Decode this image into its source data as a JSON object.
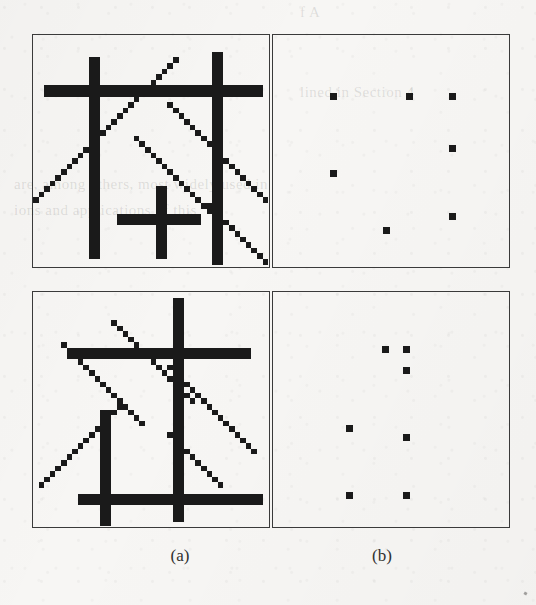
{
  "figure": {
    "kind": "line-intersection-detection-figure",
    "background_color": "#f7f6f4",
    "ink_color": "#1a1a1a",
    "border_color": "#3a3a3a",
    "page_bleed_text": [
      {
        "text": "f A",
        "x": 300,
        "y": 4,
        "size": 15
      },
      {
        "text": "lined in Section 4",
        "x": 300,
        "y": 84,
        "size": 15
      },
      {
        "text": "are, among others, most widely used in",
        "x": 14,
        "y": 176,
        "size": 15
      },
      {
        "text": "ions and applications of  this",
        "x": 14,
        "y": 202,
        "size": 15
      }
    ],
    "captions": [
      {
        "label": "(a)",
        "name": "caption-a",
        "x": 120,
        "y": 546,
        "width": 120
      },
      {
        "label": "(b)",
        "name": "caption-b",
        "x": 322,
        "y": 546,
        "width": 120
      }
    ],
    "panels": [
      {
        "name": "panel-top-left",
        "row": "top",
        "column": "a",
        "label": "(a)",
        "content": "line-drawing",
        "x": 32,
        "y": 34,
        "width": 238,
        "height": 234,
        "grid": {
          "cols": 42,
          "rows": 41,
          "cell": 5.6
        },
        "strokes": [
          {
            "name": "vertical-line-1",
            "type": "v",
            "col": 10,
            "row_start": 4,
            "row_end": 40,
            "thick": 2
          },
          {
            "name": "vertical-line-2",
            "type": "v",
            "col": 32,
            "row_start": 3,
            "row_end": 41,
            "thick": 2
          },
          {
            "name": "horizontal-line-1",
            "type": "h",
            "row": 9,
            "col_start": 2,
            "col_end": 41,
            "thick": 2
          },
          {
            "name": "horizontal-line-2",
            "type": "h",
            "row": 32,
            "col_start": 15,
            "col_end": 30,
            "thick": 2
          },
          {
            "name": "vertical-line-3",
            "type": "v",
            "col": 22,
            "row_start": 27,
            "row_end": 40,
            "thick": 2
          },
          {
            "name": "diagonal-up-1",
            "type": "d",
            "col_start": 0,
            "row_start": 29,
            "col_end": 25,
            "row_end": 6,
            "thick": 1.4
          },
          {
            "name": "diagonal-down-1",
            "type": "d",
            "col_start": 24,
            "row_start": 12,
            "col_end": 41,
            "row_end": 26,
            "thick": 1.4
          },
          {
            "name": "diagonal-down-2",
            "type": "d",
            "col_start": 18,
            "row_start": 18,
            "col_end": 33,
            "row_end": 33,
            "thick": 1.4
          },
          {
            "name": "diagonal-down-3",
            "type": "d",
            "col_start": 31,
            "row_start": 30,
            "col_end": 41,
            "row_end": 40,
            "thick": 1.4
          }
        ]
      },
      {
        "name": "panel-top-right",
        "row": "top",
        "column": "b",
        "label": "(b)",
        "content": "intersection-points",
        "x": 272,
        "y": 34,
        "width": 238,
        "height": 234,
        "dot_size": 7,
        "dots": [
          {
            "name": "intersection-point",
            "x": 57,
            "y": 58
          },
          {
            "name": "intersection-point",
            "x": 133,
            "y": 58
          },
          {
            "name": "intersection-point",
            "x": 176,
            "y": 58
          },
          {
            "name": "intersection-point",
            "x": 176,
            "y": 110
          },
          {
            "name": "intersection-point",
            "x": 57,
            "y": 135
          },
          {
            "name": "intersection-point",
            "x": 176,
            "y": 178
          },
          {
            "name": "intersection-point",
            "x": 110,
            "y": 192
          }
        ]
      },
      {
        "name": "panel-bottom-left",
        "row": "bottom",
        "column": "a",
        "label": "(a)",
        "content": "line-drawing",
        "x": 32,
        "y": 291,
        "width": 238,
        "height": 237,
        "grid": {
          "cols": 42,
          "rows": 42,
          "cell": 5.6
        },
        "strokes": [
          {
            "name": "vertical-line-1",
            "type": "v",
            "col": 25,
            "row_start": 1,
            "row_end": 41,
            "thick": 2
          },
          {
            "name": "vertical-line-2",
            "type": "v",
            "col": 12,
            "row_start": 21,
            "row_end": 42,
            "thick": 2
          },
          {
            "name": "horizontal-line-1",
            "type": "h",
            "row": 10,
            "col_start": 6,
            "col_end": 39,
            "thick": 2
          },
          {
            "name": "horizontal-line-2",
            "type": "h",
            "row": 36,
            "col_start": 8,
            "col_end": 41,
            "thick": 2
          },
          {
            "name": "diagonal-up-1",
            "type": "d",
            "col_start": 5,
            "row_start": 9,
            "col_end": 19,
            "row_end": 23,
            "thick": 1.4
          },
          {
            "name": "diagonal-down-1",
            "type": "d",
            "col_start": 14,
            "row_start": 5,
            "col_end": 28,
            "row_end": 19,
            "thick": 1.4
          },
          {
            "name": "diagonal-up-2",
            "type": "d",
            "col_start": 1,
            "row_start": 34,
            "col_end": 15,
            "row_end": 21,
            "thick": 1.4
          },
          {
            "name": "diagonal-down-2",
            "type": "d",
            "col_start": 24,
            "row_start": 13,
            "col_end": 39,
            "row_end": 27,
            "thick": 1.4
          },
          {
            "name": "diagonal-down-3",
            "type": "d",
            "col_start": 24,
            "row_start": 25,
            "col_end": 33,
            "row_end": 33,
            "thick": 1.4
          }
        ]
      },
      {
        "name": "panel-bottom-right",
        "row": "bottom",
        "column": "b",
        "label": "(b)",
        "content": "intersection-points",
        "x": 272,
        "y": 291,
        "width": 238,
        "height": 237,
        "dot_size": 7,
        "dots": [
          {
            "name": "intersection-point",
            "x": 109,
            "y": 54
          },
          {
            "name": "intersection-point",
            "x": 130,
            "y": 54
          },
          {
            "name": "intersection-point",
            "x": 130,
            "y": 75
          },
          {
            "name": "intersection-point",
            "x": 73,
            "y": 133
          },
          {
            "name": "intersection-point",
            "x": 130,
            "y": 142
          },
          {
            "name": "intersection-point",
            "x": 73,
            "y": 200
          },
          {
            "name": "intersection-point",
            "x": 130,
            "y": 200
          }
        ]
      }
    ],
    "stray_marks": [
      {
        "x": 524,
        "y": 592
      }
    ]
  }
}
